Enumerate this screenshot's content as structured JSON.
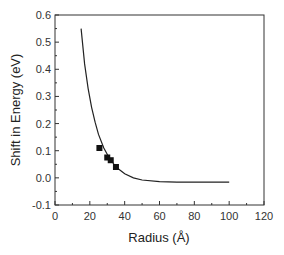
{
  "chart_data": {
    "type": "scatter",
    "title": "",
    "xlabel": "Radius (Å)",
    "ylabel": "Shift in Energy (eV)",
    "xlim": [
      0,
      120
    ],
    "ylim": [
      -0.1,
      0.6
    ],
    "xticks": [
      0,
      20,
      40,
      60,
      80,
      100,
      120
    ],
    "yticks": [
      -0.1,
      0.0,
      0.1,
      0.2,
      0.3,
      0.4,
      0.5,
      0.6
    ],
    "xtick_labels": [
      "0",
      "20",
      "40",
      "60",
      "80",
      "100",
      "120"
    ],
    "ytick_labels": [
      "-0.1",
      "0.0",
      "0.1",
      "0.2",
      "0.3",
      "0.4",
      "0.5",
      "0.6"
    ],
    "grid": false,
    "legend": null,
    "series": [
      {
        "name": "measured",
        "kind": "markers",
        "marker": "square",
        "color": "#111111",
        "x": [
          25.5,
          30,
          32,
          35
        ],
        "y": [
          0.11,
          0.075,
          0.065,
          0.04
        ]
      },
      {
        "name": "model",
        "kind": "line",
        "color": "#222222",
        "x": [
          15,
          17,
          19,
          21,
          23,
          25,
          28,
          31,
          35,
          40,
          45,
          50,
          60,
          70,
          80,
          90,
          100
        ],
        "y": [
          0.55,
          0.42,
          0.33,
          0.26,
          0.205,
          0.16,
          0.11,
          0.075,
          0.04,
          0.015,
          0.0,
          -0.008,
          -0.014,
          -0.016,
          -0.016,
          -0.016,
          -0.016
        ]
      }
    ]
  }
}
